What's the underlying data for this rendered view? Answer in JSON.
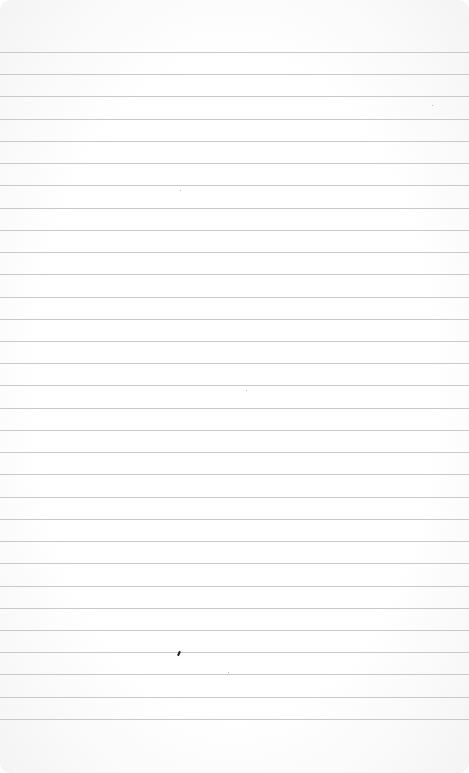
{
  "paper": {
    "type": "lined-notepaper",
    "background_color": "#ffffff",
    "rule_color": "#c9c9c9",
    "rule_count": 31,
    "first_rule_y": 52,
    "rule_spacing": 22.23
  },
  "marks": [
    {
      "kind": "pen-dot",
      "x": 178,
      "y": 651,
      "color": "#222222"
    }
  ],
  "specks": [
    {
      "x": 180,
      "y": 190
    },
    {
      "x": 246,
      "y": 390
    },
    {
      "x": 228,
      "y": 672
    },
    {
      "x": 432,
      "y": 105
    }
  ]
}
